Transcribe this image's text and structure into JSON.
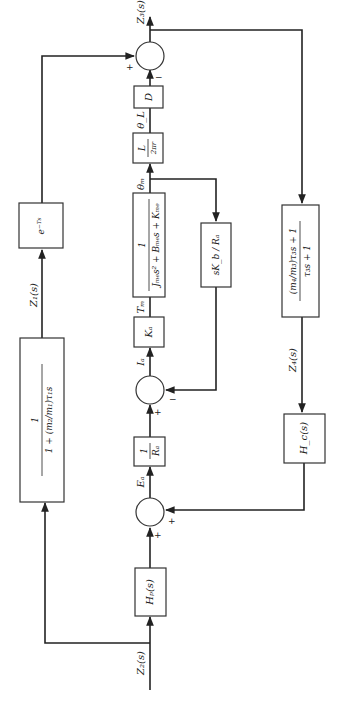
{
  "diagram": {
    "orientation": "rotated-90-ccw",
    "signals": {
      "z2": "Z₂(s)",
      "z1": "Z₁(s)",
      "z3": "Z₃(s)",
      "z4": "Z₄(s)",
      "ea": "Eₐ",
      "ia": "Iₐ",
      "tm": "Tₘ",
      "theta_m": "θₘ",
      "theta_l": "θ_L"
    },
    "blocks": {
      "hp": "Hₚ(s)",
      "inv_ra_num": "1",
      "inv_ra_den": "Rₐ",
      "ka": "Kₐ",
      "plant_num": "1",
      "plant_den": "Jₘₑs² + Bₘₑs + Kₘₑ",
      "gear_num": "L",
      "gear_den": "2πr",
      "d": "D",
      "back_emf": "sK_b / Rₐ",
      "z1_num": "1",
      "z1_den": "1 + (m₂/m₁)τ₁s",
      "delay": "e⁻ᵀˢ",
      "z4_num": "(m₄/m₃)τ₃s + 1",
      "z4_den": "τ₃s + 1",
      "hc": "H_c(s)"
    },
    "signs": {
      "sum1_bottom": "+",
      "sum1_right": "+",
      "sum2_bottom": "+",
      "sum2_right": "−",
      "sum3_left": "+",
      "sum3_bottom": "−"
    }
  }
}
